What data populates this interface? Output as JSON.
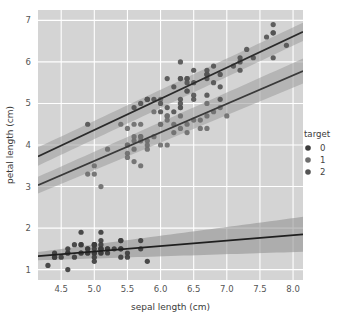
{
  "chart_data": {
    "type": "scatter",
    "title": "",
    "xlabel": "sepal length (cm)",
    "ylabel": "petal length (cm)",
    "xlim": [
      4.15,
      8.15
    ],
    "ylim": [
      0.75,
      7.25
    ],
    "xticks": [
      "4.5",
      "5.0",
      "5.5",
      "6.0",
      "6.5",
      "7.0",
      "7.5",
      "8.0"
    ],
    "xtick_values": [
      4.5,
      5.0,
      5.5,
      6.0,
      6.5,
      7.0,
      7.5,
      8.0
    ],
    "yticks": [
      "1",
      "2",
      "3",
      "4",
      "5",
      "6",
      "7"
    ],
    "ytick_values": [
      1,
      2,
      3,
      4,
      5,
      6,
      7
    ],
    "grid": true,
    "grid_color": "#ffffff",
    "panel_color": "#d4d4d4",
    "figure_color": "#ffffff",
    "legend": {
      "title": "target",
      "position": "right",
      "entries": [
        {
          "label": "0",
          "color": "#3d3d3d"
        },
        {
          "label": "1",
          "color": "#6e6e6e"
        },
        {
          "label": "2",
          "color": "#545454"
        }
      ]
    },
    "series": [
      {
        "name": "0",
        "color": "#3d3d3d",
        "fit_color": "#1f1f1f",
        "band_color": "#8c8c8c",
        "fit": {
          "slope": 0.1316,
          "intercept": 0.7774
        },
        "band_halfwidth": {
          "at_xmin": 0.1,
          "at_xmax": 0.42
        },
        "points": [
          [
            5.1,
            1.4
          ],
          [
            4.9,
            1.4
          ],
          [
            4.7,
            1.3
          ],
          [
            4.6,
            1.5
          ],
          [
            5.0,
            1.4
          ],
          [
            5.4,
            1.7
          ],
          [
            4.6,
            1.4
          ],
          [
            5.0,
            1.5
          ],
          [
            4.4,
            1.4
          ],
          [
            4.9,
            1.5
          ],
          [
            5.4,
            1.5
          ],
          [
            4.8,
            1.6
          ],
          [
            4.8,
            1.4
          ],
          [
            4.3,
            1.1
          ],
          [
            5.8,
            1.2
          ],
          [
            5.7,
            1.5
          ],
          [
            5.4,
            1.3
          ],
          [
            5.1,
            1.4
          ],
          [
            5.7,
            1.7
          ],
          [
            5.1,
            1.5
          ],
          [
            5.4,
            1.7
          ],
          [
            5.1,
            1.5
          ],
          [
            4.6,
            1.0
          ],
          [
            5.1,
            1.7
          ],
          [
            4.8,
            1.9
          ],
          [
            5.0,
            1.6
          ],
          [
            5.0,
            1.6
          ],
          [
            5.2,
            1.5
          ],
          [
            5.2,
            1.4
          ],
          [
            4.7,
            1.6
          ],
          [
            4.8,
            1.6
          ],
          [
            5.4,
            1.5
          ],
          [
            5.2,
            1.5
          ],
          [
            5.5,
            1.4
          ],
          [
            4.9,
            1.5
          ],
          [
            5.0,
            1.2
          ],
          [
            5.5,
            1.3
          ],
          [
            4.9,
            1.4
          ],
          [
            4.4,
            1.3
          ],
          [
            5.1,
            1.5
          ],
          [
            5.0,
            1.3
          ],
          [
            4.5,
            1.3
          ],
          [
            4.4,
            1.3
          ],
          [
            5.0,
            1.6
          ],
          [
            5.1,
            1.9
          ],
          [
            4.8,
            1.4
          ],
          [
            5.1,
            1.6
          ],
          [
            4.6,
            1.4
          ],
          [
            5.3,
            1.5
          ],
          [
            5.0,
            1.4
          ]
        ]
      },
      {
        "name": "1",
        "color": "#6e6e6e",
        "fit_color": "#3a3a3a",
        "band_color": "#9a9a9a",
        "fit": {
          "slope": 0.6865,
          "intercept": 0.1851
        },
        "band_halfwidth": {
          "at_xmin": 0.2,
          "at_xmax": 0.3
        },
        "points": [
          [
            7.0,
            4.7
          ],
          [
            6.4,
            4.5
          ],
          [
            6.9,
            4.9
          ],
          [
            5.5,
            4.0
          ],
          [
            6.5,
            4.6
          ],
          [
            5.7,
            4.5
          ],
          [
            6.3,
            4.7
          ],
          [
            4.9,
            3.3
          ],
          [
            6.6,
            4.6
          ],
          [
            5.2,
            3.9
          ],
          [
            5.0,
            3.5
          ],
          [
            5.9,
            4.2
          ],
          [
            6.0,
            4.0
          ],
          [
            6.1,
            4.7
          ],
          [
            5.6,
            3.6
          ],
          [
            6.7,
            4.4
          ],
          [
            5.6,
            4.5
          ],
          [
            5.8,
            4.1
          ],
          [
            6.2,
            4.5
          ],
          [
            5.6,
            3.9
          ],
          [
            5.9,
            4.8
          ],
          [
            6.1,
            4.0
          ],
          [
            6.3,
            4.9
          ],
          [
            6.1,
            4.7
          ],
          [
            6.4,
            4.3
          ],
          [
            6.6,
            4.4
          ],
          [
            6.8,
            4.8
          ],
          [
            6.7,
            5.0
          ],
          [
            6.0,
            4.5
          ],
          [
            5.7,
            3.5
          ],
          [
            5.5,
            3.8
          ],
          [
            5.5,
            3.7
          ],
          [
            5.8,
            3.9
          ],
          [
            6.0,
            5.1
          ],
          [
            5.4,
            4.5
          ],
          [
            6.0,
            4.5
          ],
          [
            6.7,
            4.7
          ],
          [
            6.3,
            4.4
          ],
          [
            5.6,
            4.1
          ],
          [
            5.5,
            4.0
          ],
          [
            5.5,
            4.4
          ],
          [
            6.1,
            4.6
          ],
          [
            5.8,
            4.0
          ],
          [
            5.0,
            3.3
          ],
          [
            5.6,
            4.2
          ],
          [
            5.7,
            4.2
          ],
          [
            5.7,
            4.2
          ],
          [
            6.2,
            4.3
          ],
          [
            5.1,
            3.0
          ],
          [
            5.7,
            4.1
          ]
        ]
      },
      {
        "name": "2",
        "color": "#545454",
        "fit_color": "#2b2b2b",
        "band_color": "#9a9a9a",
        "fit": {
          "slope": 0.7501,
          "intercept": 0.6105
        },
        "band_halfwidth": {
          "at_xmin": 0.22,
          "at_xmax": 0.22
        },
        "points": [
          [
            6.3,
            6.0
          ],
          [
            5.8,
            5.1
          ],
          [
            7.1,
            5.9
          ],
          [
            6.3,
            5.6
          ],
          [
            6.5,
            5.8
          ],
          [
            7.6,
            6.6
          ],
          [
            4.9,
            4.5
          ],
          [
            7.3,
            6.3
          ],
          [
            6.7,
            5.8
          ],
          [
            7.2,
            6.1
          ],
          [
            6.5,
            5.1
          ],
          [
            6.4,
            5.3
          ],
          [
            6.8,
            5.5
          ],
          [
            5.7,
            5.0
          ],
          [
            5.8,
            5.1
          ],
          [
            6.4,
            5.3
          ],
          [
            6.5,
            5.5
          ],
          [
            7.7,
            6.7
          ],
          [
            7.7,
            6.9
          ],
          [
            6.0,
            5.0
          ],
          [
            6.9,
            5.7
          ],
          [
            5.6,
            4.9
          ],
          [
            7.7,
            6.7
          ],
          [
            6.3,
            4.9
          ],
          [
            6.7,
            5.7
          ],
          [
            7.2,
            6.0
          ],
          [
            6.2,
            4.8
          ],
          [
            6.1,
            4.9
          ],
          [
            6.4,
            5.6
          ],
          [
            7.2,
            5.8
          ],
          [
            7.4,
            6.1
          ],
          [
            7.9,
            6.4
          ],
          [
            6.4,
            5.6
          ],
          [
            6.3,
            5.1
          ],
          [
            6.1,
            5.6
          ],
          [
            7.7,
            6.1
          ],
          [
            6.3,
            5.6
          ],
          [
            6.4,
            5.5
          ],
          [
            6.0,
            4.8
          ],
          [
            6.9,
            5.4
          ],
          [
            6.7,
            5.6
          ],
          [
            6.9,
            5.1
          ],
          [
            5.8,
            5.1
          ],
          [
            6.8,
            5.9
          ],
          [
            6.7,
            5.7
          ],
          [
            6.7,
            5.2
          ],
          [
            6.3,
            5.0
          ],
          [
            6.5,
            5.2
          ],
          [
            6.2,
            5.4
          ],
          [
            5.9,
            5.1
          ]
        ]
      }
    ]
  }
}
